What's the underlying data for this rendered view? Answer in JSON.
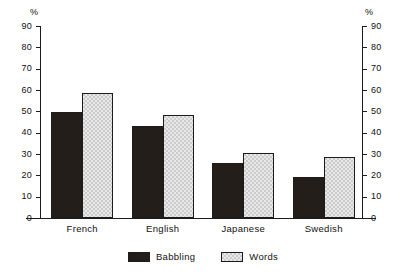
{
  "chart_data": {
    "type": "bar",
    "title": "",
    "subtitle": "",
    "xlabel": "",
    "ylabel": "%",
    "ylabel_right": "%",
    "categories": [
      "French",
      "English",
      "Japanese",
      "Swedish"
    ],
    "series": [
      {
        "name": "Babbling",
        "color": "#241e1b",
        "values": [
          49.5,
          43,
          26,
          19
        ]
      },
      {
        "name": "Words",
        "color": "#cccccc",
        "values": [
          58.5,
          48.5,
          30.5,
          28.5
        ]
      }
    ],
    "ylim": [
      0,
      90
    ],
    "ytick_step": 10,
    "yticks": [
      0,
      10,
      20,
      30,
      40,
      50,
      60,
      70,
      80,
      90
    ],
    "yticks_right": [
      0,
      10,
      20,
      30,
      40,
      50,
      60,
      70,
      80,
      90
    ],
    "grid": false,
    "legend_position": "bottom-center",
    "dual_axis": true,
    "annotations": []
  },
  "legend": {
    "items": [
      {
        "label": "Babbling"
      },
      {
        "label": "Words"
      }
    ]
  }
}
